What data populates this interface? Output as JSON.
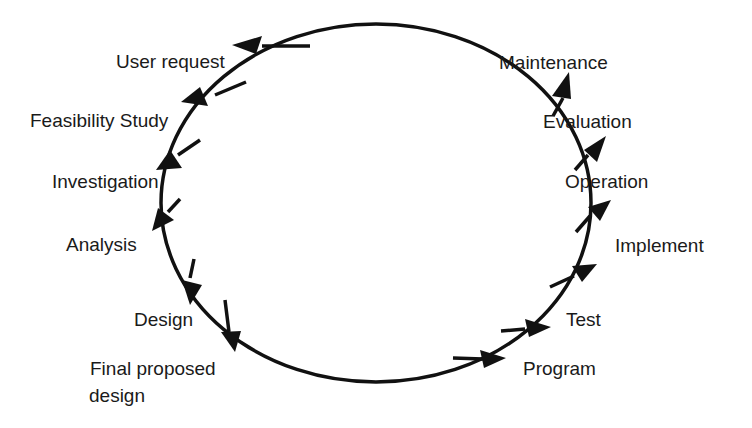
{
  "diagram": {
    "type": "cycle",
    "direction": "counter-clockwise",
    "stroke_color": "#111111",
    "stages": [
      {
        "id": "user-request",
        "label": "User request"
      },
      {
        "id": "feasibility-study",
        "label": "Feasibility Study"
      },
      {
        "id": "investigation",
        "label": "Investigation"
      },
      {
        "id": "analysis",
        "label": "Analysis"
      },
      {
        "id": "design",
        "label": "Design"
      },
      {
        "id": "final-proposed-design",
        "label_line1": "Final proposed",
        "label_line2": "design"
      },
      {
        "id": "program",
        "label": "Program"
      },
      {
        "id": "test",
        "label": "Test"
      },
      {
        "id": "implement",
        "label": "Implement"
      },
      {
        "id": "operation",
        "label": "Operation"
      },
      {
        "id": "evaluation",
        "label": "Evaluation"
      },
      {
        "id": "maintenance",
        "label": "Maintenance"
      }
    ]
  }
}
